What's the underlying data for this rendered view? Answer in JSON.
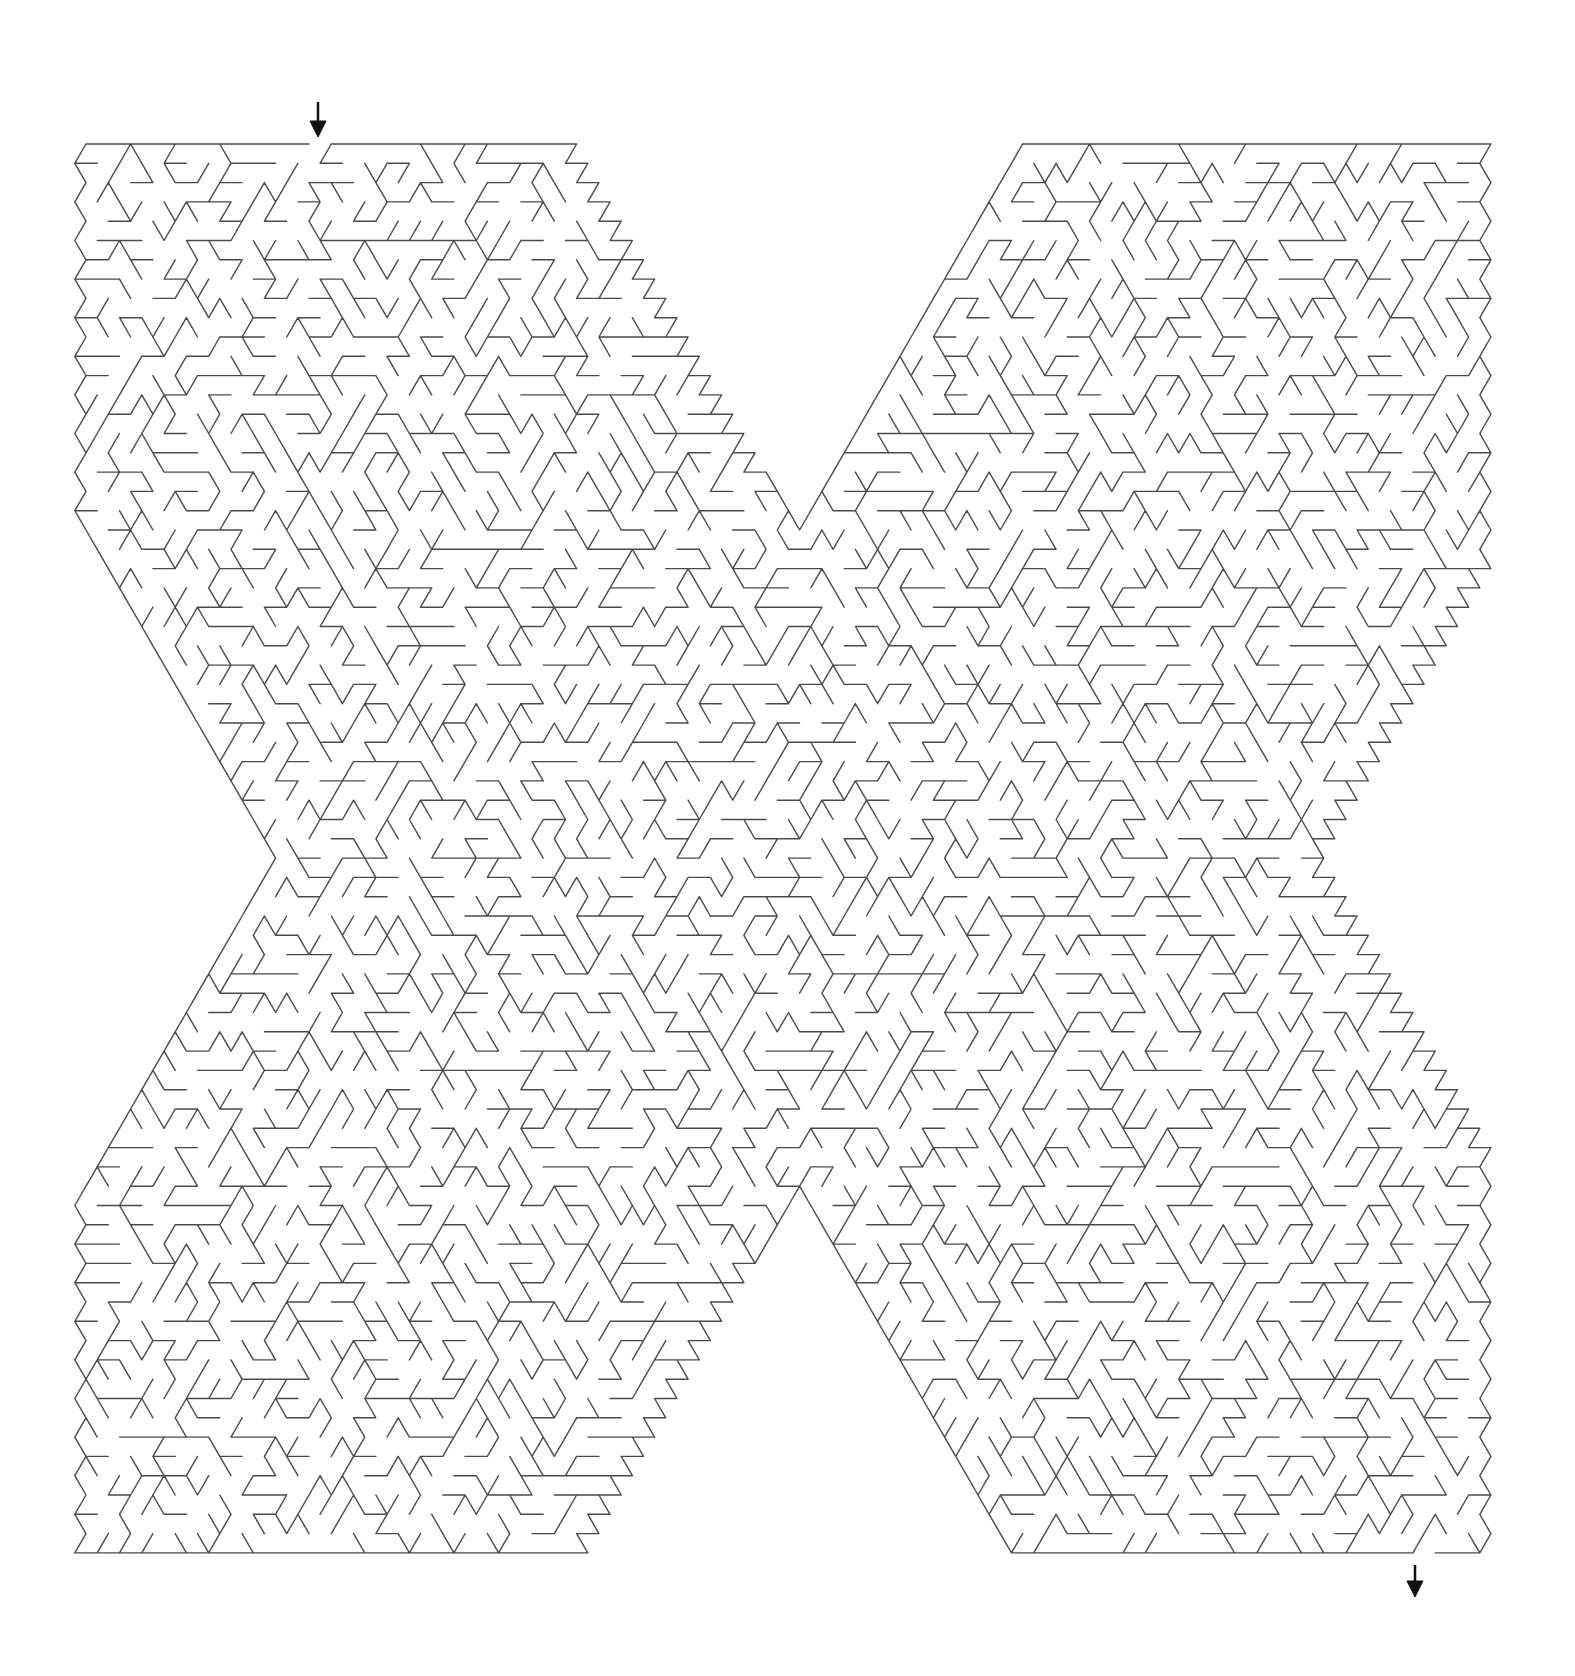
{
  "puzzle": {
    "type": "maze",
    "shape": "X",
    "grid": "triangular",
    "colors": {
      "background": "#ffffff",
      "wall": "#4a4a4a",
      "arrow": "#111111"
    },
    "entrance": {
      "label": "start-arrow",
      "x": 318,
      "y_top": 102,
      "y_tip": 137,
      "gap": [
        306,
        330
      ]
    },
    "exit": {
      "label": "end-arrow",
      "x": 1415,
      "y_top": 1565,
      "y_tip": 1597,
      "gap": [
        1402,
        1428
      ]
    },
    "outline": {
      "top_y": 144,
      "bottom_y": 1557,
      "left_x": 86,
      "right_x": 1488,
      "top_left_lobe_right_x": 564,
      "top_right_lobe_left_x": 1025,
      "bottom_left_lobe_right_x": 572,
      "bottom_right_lobe_left_x": 1010,
      "top_notch_apex": [
        793,
        530
      ],
      "bottom_notch_apex": [
        793,
        1187
      ],
      "left_notch_apex": [
        273,
        859
      ],
      "right_notch_apex": [
        1313,
        859
      ]
    },
    "cell": {
      "row_height": 19.3,
      "unit_width": 22.3
    },
    "seed": 20240611
  }
}
